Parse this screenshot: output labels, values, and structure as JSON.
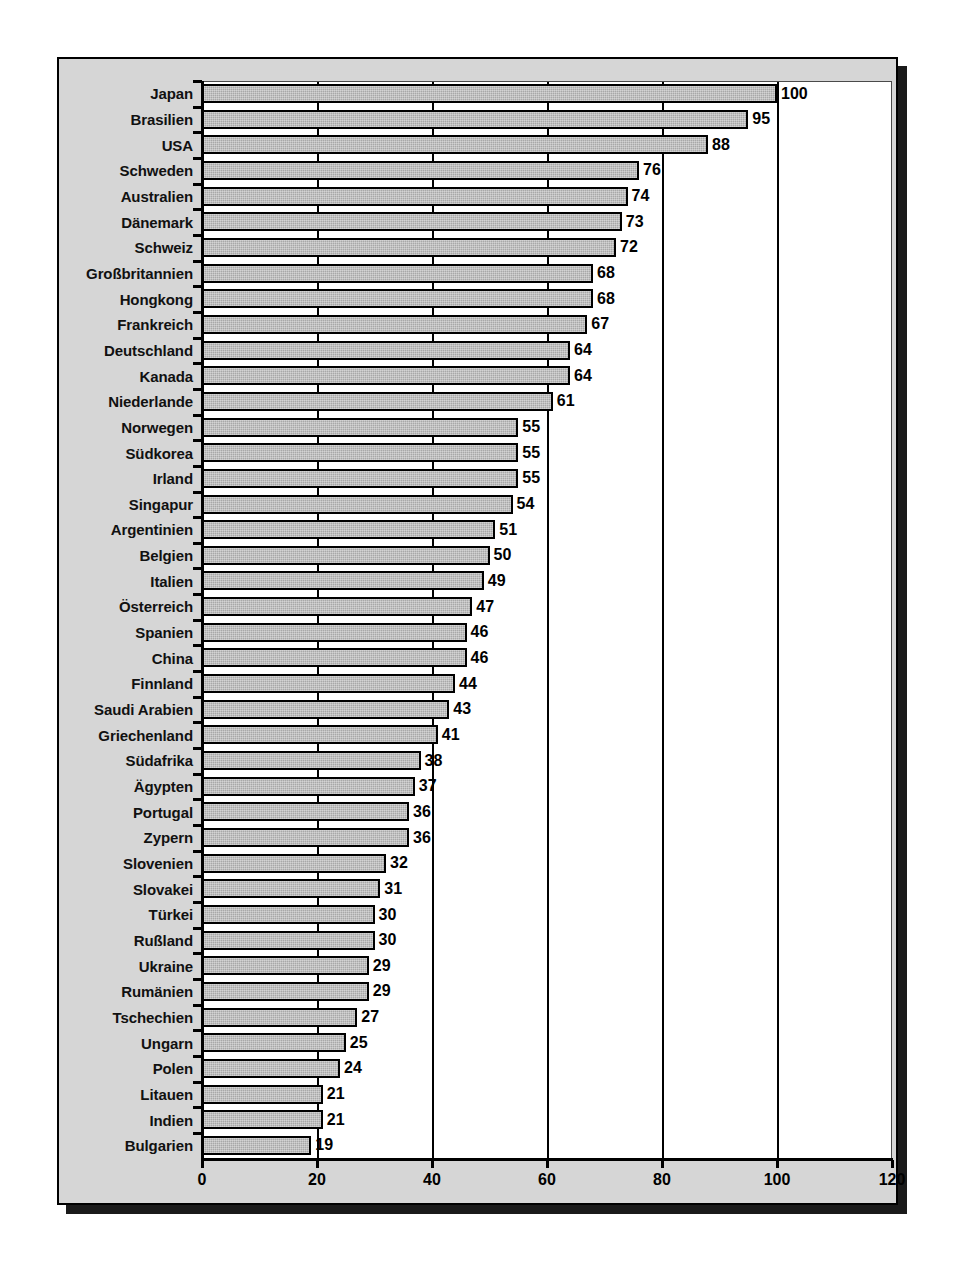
{
  "chart_data": {
    "type": "bar",
    "orientation": "horizontal",
    "title": "",
    "subtitle": "",
    "xlabel": "",
    "ylabel": "",
    "xlim": [
      0,
      120
    ],
    "xticks": [
      0,
      20,
      40,
      60,
      80,
      100,
      120
    ],
    "grid": true,
    "gridlines_x": [
      20,
      40,
      60,
      80,
      100
    ],
    "legend": null,
    "categories": [
      "Japan",
      "Brasilien",
      "USA",
      "Schweden",
      "Australien",
      "Dänemark",
      "Schweiz",
      "Großbritannien",
      "Hongkong",
      "Frankreich",
      "Deutschland",
      "Kanada",
      "Niederlande",
      "Norwegen",
      "Südkorea",
      "Irland",
      "Singapur",
      "Argentinien",
      "Belgien",
      "Italien",
      "Österreich",
      "Spanien",
      "China",
      "Finnland",
      "Saudi Arabien",
      "Griechenland",
      "Südafrika",
      "Ägypten",
      "Portugal",
      "Zypern",
      "Slovenien",
      "Slovakei",
      "Türkei",
      "Rußland",
      "Ukraine",
      "Rumänien",
      "Tschechien",
      "Ungarn",
      "Polen",
      "Litauen",
      "Indien",
      "Bulgarien"
    ],
    "values": [
      100,
      95,
      88,
      76,
      74,
      73,
      72,
      68,
      68,
      67,
      64,
      64,
      61,
      55,
      55,
      55,
      54,
      51,
      50,
      49,
      47,
      46,
      46,
      44,
      43,
      41,
      38,
      37,
      36,
      36,
      32,
      31,
      30,
      30,
      29,
      29,
      27,
      25,
      24,
      21,
      21,
      19
    ],
    "colors": {
      "bar_fill": "#a8a8a8",
      "bar_border": "#000000",
      "panel_background": "#d6d6d6",
      "plot_background": "#ffffff",
      "gridline": "#000000",
      "text": "#000000"
    }
  }
}
